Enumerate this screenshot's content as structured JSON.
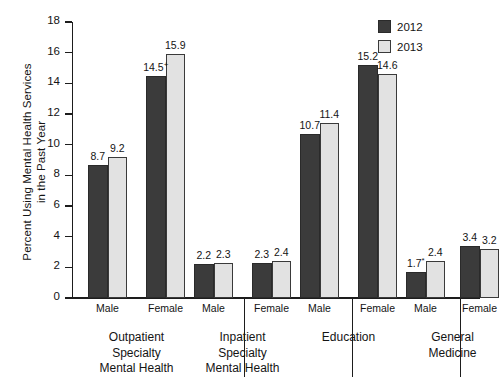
{
  "chart_data": {
    "type": "bar",
    "title": "",
    "xlabel": "",
    "ylabel": "Percent Using Mental Health Services\nin the Past Year",
    "ylim": [
      0,
      18
    ],
    "yticks": [
      0,
      2,
      4,
      6,
      8,
      10,
      12,
      14,
      16,
      18
    ],
    "grid": false,
    "legend_position": "top-right",
    "categories": [
      "Outpatient Specialty Mental Health - Male",
      "Outpatient Specialty Mental Health - Female",
      "Inpatient Specialty Mental Health - Male",
      "Inpatient Specialty Mental Health - Female",
      "Education - Male",
      "Education - Female",
      "General Medicine - Male",
      "General Medicine - Female"
    ],
    "series": [
      {
        "name": "2012",
        "color": "#3b3b3b",
        "values": [
          8.7,
          14.5,
          2.2,
          2.3,
          10.7,
          15.2,
          1.7,
          3.4
        ]
      },
      {
        "name": "2013",
        "color": "#e2e2e2",
        "values": [
          9.2,
          15.9,
          2.3,
          2.4,
          11.4,
          14.6,
          2.4,
          3.2
        ]
      }
    ],
    "data_labels": [
      {
        "text": "8.7",
        "marker": ""
      },
      {
        "text": "9.2",
        "marker": ""
      },
      {
        "text": "14.5",
        "marker": "+"
      },
      {
        "text": "15.9",
        "marker": ""
      },
      {
        "text": "2.2",
        "marker": ""
      },
      {
        "text": "2.3",
        "marker": ""
      },
      {
        "text": "2.3",
        "marker": ""
      },
      {
        "text": "2.4",
        "marker": ""
      },
      {
        "text": "10.7",
        "marker": ""
      },
      {
        "text": "11.4",
        "marker": ""
      },
      {
        "text": "15.2",
        "marker": ""
      },
      {
        "text": "14.6",
        "marker": ""
      },
      {
        "text": "1.7",
        "marker": "*"
      },
      {
        "text": "2.4",
        "marker": ""
      },
      {
        "text": "3.4",
        "marker": ""
      },
      {
        "text": "3.2",
        "marker": ""
      }
    ],
    "groups": [
      {
        "label": "Outpatient\nSpecialty\nMental Health",
        "sublabels": [
          "Male",
          "Female"
        ]
      },
      {
        "label": "Inpatient\nSpecialty\nMental Health",
        "sublabels": [
          "Male",
          "Female"
        ]
      },
      {
        "label": "Education",
        "sublabels": [
          "Male",
          "Female"
        ]
      },
      {
        "label": "General\nMedicine",
        "sublabels": [
          "Male",
          "Female"
        ]
      }
    ],
    "legend": [
      {
        "label": "2012",
        "color": "#3b3b3b"
      },
      {
        "label": "2013",
        "color": "#e2e2e2"
      }
    ]
  },
  "axis": {
    "tick_labels": [
      "18",
      "16",
      "14",
      "12",
      "10",
      "8",
      "6",
      "4",
      "2",
      "0"
    ],
    "y_title": "Percent Using Mental Health Services\nin the Past Year"
  }
}
